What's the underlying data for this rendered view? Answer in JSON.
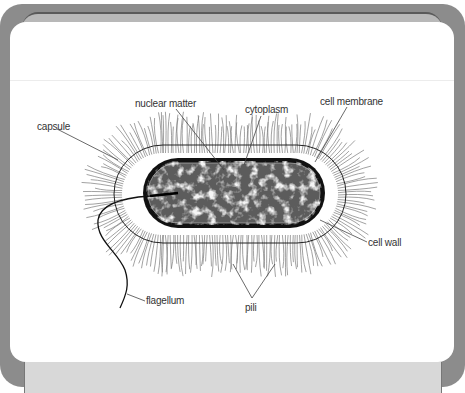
{
  "diagram": {
    "type": "labeled-illustration",
    "labels": {
      "nuclear_matter": "nuclear matter",
      "cytoplasm": "cytoplasm",
      "cell_membrane": "cell membrane",
      "capsule": "capsule",
      "cell_wall": "cell wall",
      "flagellum": "flagellum",
      "pili": "pili"
    },
    "colors": {
      "frame": "#8c8c8c",
      "card": "#ffffff",
      "strip": "#d8d8d8",
      "cell_wall": "#111111",
      "cytoplasm": "#5a5a5a",
      "nuclear_matter": "#e6e6e6",
      "pili": "#777777",
      "label_text": "#333333"
    }
  }
}
